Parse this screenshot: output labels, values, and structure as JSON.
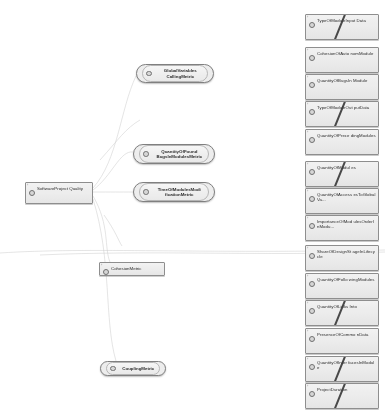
{
  "diagram": {
    "background_color": "#ffffff",
    "node_fill": "#f0f0f0",
    "node_border": "#8c8c8c",
    "edge_color": "#cfcfcf",
    "slash_color": "#2a2a2a"
  },
  "root": {
    "label": "SoftwareProject Quality",
    "x": 25,
    "y": 182,
    "w": 68,
    "h": 22
  },
  "metric_nodes": [
    {
      "label": "GlobalVariables CallingMetric",
      "x": 136,
      "y": 64,
      "w": 78,
      "h": 19,
      "shape": "ellipse"
    },
    {
      "label": "QuantityOfFound BugsInModulesMetric",
      "x": 133,
      "y": 144,
      "w": 82,
      "h": 20,
      "shape": "ellipse"
    },
    {
      "label": "TimeOfModulesModi ficationMetric",
      "x": 133,
      "y": 182,
      "w": 82,
      "h": 20,
      "shape": "ellipse"
    },
    {
      "label": "CohesionMetric",
      "x": 99,
      "y": 262,
      "w": 66,
      "h": 14,
      "shape": "rect"
    },
    {
      "label": "CouplingMetric",
      "x": 100,
      "y": 361,
      "w": 66,
      "h": 15,
      "shape": "ellipse"
    }
  ],
  "leaf_nodes": [
    {
      "label": "TypeOfModuleInput Data",
      "y": 14,
      "slash": true
    },
    {
      "label": "CohesionOfAuto nomModule",
      "y": 47,
      "slash": false
    },
    {
      "label": "QuantityOfBugsIn Module",
      "y": 74,
      "slash": false
    },
    {
      "label": "TypeOfModuleOut putData",
      "y": 101,
      "slash": true
    },
    {
      "label": "QuantityOfPrece dingModules",
      "y": 129,
      "slash": false
    },
    {
      "label": "QuantityOfModul es",
      "y": 161,
      "slash": true
    },
    {
      "label": "QuantityOfAccess esToGlobalVa...",
      "y": 188,
      "slash": false
    },
    {
      "label": "ImportanceOfMod ulesOrderInModu...",
      "y": 215,
      "slash": false
    },
    {
      "label": "ShareOfDesignSt ageInLifecycle",
      "y": 245,
      "slash": false
    },
    {
      "label": "QuantityOfFollo wingModules",
      "y": 273,
      "slash": false
    },
    {
      "label": "QuantityOfLinks Into",
      "y": 300,
      "slash": true
    },
    {
      "label": "PresenceOfCommo nData",
      "y": 328,
      "slash": false
    },
    {
      "label": "QuantityOfInter facesInModule",
      "y": 356,
      "slash": true
    },
    {
      "label": "ProjectDuration",
      "y": 383,
      "slash": true
    }
  ]
}
